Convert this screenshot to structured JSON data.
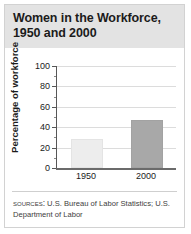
{
  "chart_data": {
    "type": "bar",
    "title": "Women in the Workforce, 1950 and 2000",
    "title_line1": "Women in the Workforce,",
    "title_line2": "1950 and 2000",
    "categories": [
      "1950",
      "2000"
    ],
    "values": [
      26,
      45
    ],
    "series": [
      {
        "name": "Percentage of workforce",
        "values": [
          26,
          45
        ]
      }
    ],
    "xlabel": "",
    "ylabel": "Percentage of workforce",
    "ylim": [
      0,
      100
    ],
    "ytick_labels": [
      "0",
      "20",
      "40",
      "60",
      "80",
      "100"
    ],
    "ytick_values": [
      0,
      20,
      40,
      60,
      80,
      100
    ],
    "yminor_values": [
      10,
      30,
      50,
      70,
      90
    ],
    "grid": true,
    "legend": "none",
    "bar_colors": [
      "#ededed",
      "#a8a8a8"
    ]
  },
  "sources": {
    "label": "Sources:",
    "text": " U.S. Bureau of Labor Statistics; U.S. Department of Labor"
  },
  "colors": {
    "title_band": "#e3e3e3",
    "border": "#d2d2d2",
    "gridline": "#dcdcdc",
    "axis": "#575757",
    "text": "#1b1b1b"
  }
}
